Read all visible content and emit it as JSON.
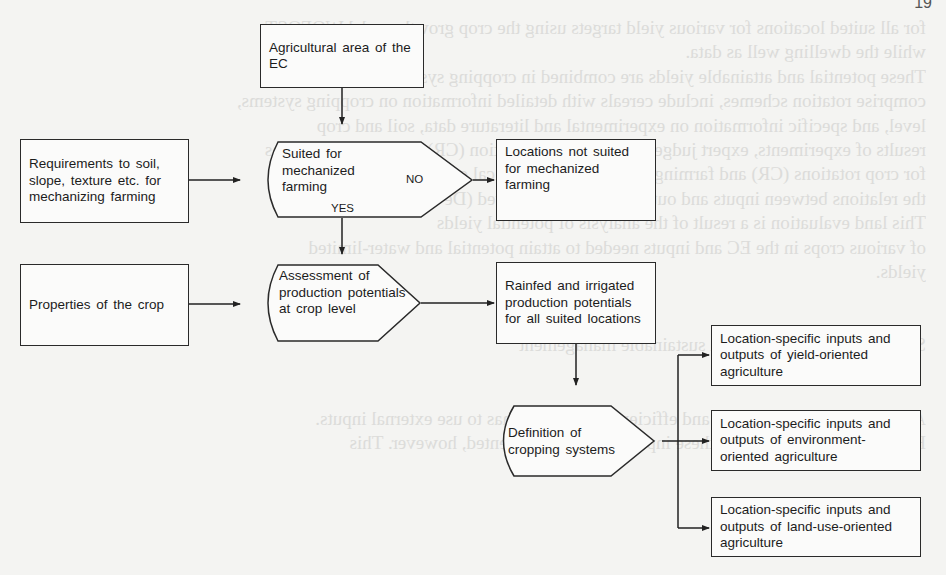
{
  "page_number": "19",
  "flowchart": {
    "start": {
      "label": "Agricultural area of the EC"
    },
    "requirements": {
      "label": "Requirements to soil, slope, texture etc. for mechanizing farming"
    },
    "decision": {
      "label": "Suited for mechanized farming",
      "no_label": "NO",
      "yes_label": "YES"
    },
    "not_suited": {
      "label": "Locations not suited for mechanized farming"
    },
    "crop_properties": {
      "label": "Properties of the crop"
    },
    "assessment": {
      "label": "Assessment of production potentials at crop level"
    },
    "rainfed": {
      "label": "Rainfed and irrigated production potentials for all suited locations"
    },
    "definition": {
      "label": "Definition of cropping systems"
    },
    "outputs": [
      {
        "label": "Location-specific inputs and outputs of yield-oriented agriculture"
      },
      {
        "label": "Location-specific inputs and outputs of environment-oriented agriculture"
      },
      {
        "label": "Location-specific inputs and outputs of land-use-oriented agriculture"
      }
    ]
  },
  "bleed_text": "for all suited locations for various yield targets using the crop growth model WOFOST\nwhile the dwelling well as data.\nThese potential and attainable yields are combined in cropping systems that\ncomprise rotation schemes, include cereals with detailed information on cropping systems,\nlevel, and specific information on experimental and literature data, soil and crop\nresults of experiments, expert judgements, and crop rotation (CR) and farming systems\nfor crop rotations (CR) and farming systems (FS), technical coefficients representing\nthe relations between inputs and outputs have been derived (De Koning et al., 1992).\nThis land evaluation is a result of the analysis of potential yields\nof various crops in the EC and inputs needed to attain potential and water-limited\nyields.\n\n\nSystems for agriculture with sustainable management\n\n\nAgriculture systems of high and efficient productivity has to use external inputs.\nHowever, inefficient use of these inputs should be prevented, however. This"
}
